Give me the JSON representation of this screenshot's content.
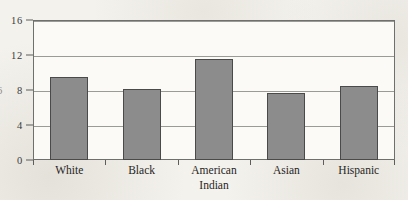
{
  "chart_data": {
    "type": "bar",
    "title": "",
    "subtitle": "",
    "xlabel": "",
    "ylabel": "",
    "categories": [
      "White",
      "Black",
      "American Indian",
      "Asian",
      "Hispanic"
    ],
    "category_lines": [
      [
        "White"
      ],
      [
        "Black"
      ],
      [
        "American",
        "Indian"
      ],
      [
        "Asian"
      ],
      [
        "Hispanic"
      ]
    ],
    "values": [
      9.5,
      8.1,
      11.6,
      7.7,
      8.5
    ],
    "series": [
      {
        "name": "",
        "values": [
          9.5,
          8.1,
          11.6,
          7.7,
          8.5
        ]
      }
    ],
    "ylim": [
      0,
      16
    ],
    "yticks": [
      0,
      4,
      8,
      12,
      16
    ],
    "ytick_labels": [
      "0",
      "4",
      "8",
      "12",
      "16"
    ],
    "grid": true,
    "grid_axis": "y",
    "legend": false,
    "legend_position": "none",
    "annotations": [],
    "colors": {
      "bar_fill": "#8c8c8c",
      "bar_stroke": "#4a4a4a",
      "gridline": "#9a9a97",
      "frame": "#6f6f6d",
      "plot_background": "#fbfaf7",
      "page_background": "#f3f1ec",
      "text": "#262523"
    }
  },
  "edge_artifact": {
    "cropped_glyph": "6"
  }
}
